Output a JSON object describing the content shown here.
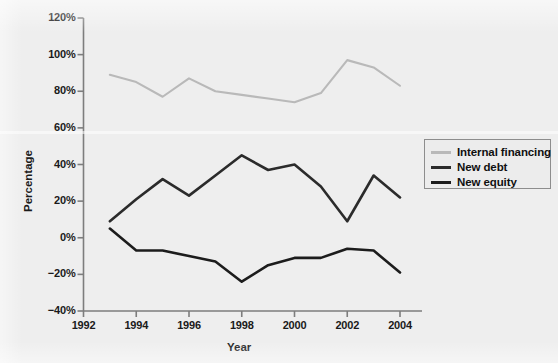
{
  "figure": {
    "background_color": "#efefef",
    "plot_background_color": "#eeeeee"
  },
  "axes": {
    "ylabel": "Percentage",
    "xlabel": "Year",
    "ytick_labels": [
      "120%",
      "100%",
      "80%",
      "60%",
      "40%",
      "20%",
      "0%",
      "−20%",
      "−40%"
    ],
    "xtick_labels": [
      "1992",
      "1994",
      "1996",
      "1998",
      "2000",
      "2002",
      "2004"
    ]
  },
  "legend": {
    "items": [
      {
        "label": "Internal financing",
        "color": "#b9b9b9"
      },
      {
        "label": "New debt",
        "color": "#2b2b2b"
      },
      {
        "label": "New equity",
        "color": "#1c1c1c"
      }
    ]
  },
  "chart_data": {
    "type": "line",
    "title": "",
    "xlabel": "Year",
    "ylabel": "Percentage",
    "x": [
      1993,
      1994,
      1995,
      1996,
      1997,
      1998,
      1999,
      2000,
      2001,
      2002,
      2003,
      2004
    ],
    "xlim": [
      1992,
      2004
    ],
    "ylim": [
      -40,
      120
    ],
    "ytick_values": [
      120,
      100,
      80,
      60,
      40,
      20,
      0,
      -20,
      -40
    ],
    "xtick_values": [
      1992,
      1994,
      1996,
      1998,
      2000,
      2002,
      2004
    ],
    "grid": false,
    "legend_position": "right",
    "series": [
      {
        "name": "Internal financing",
        "color": "#b9b9b9",
        "values": [
          89,
          85,
          77,
          87,
          80,
          78,
          76,
          74,
          79,
          97,
          93,
          83
        ]
      },
      {
        "name": "New debt",
        "color": "#2b2b2b",
        "values": [
          9,
          21,
          32,
          23,
          34,
          45,
          37,
          40,
          28,
          9,
          34,
          22
        ]
      },
      {
        "name": "New equity",
        "color": "#1c1c1c",
        "values": [
          5,
          -7,
          -7,
          -10,
          -13,
          -24,
          -15,
          -11,
          -11,
          -6,
          -7,
          -19
        ]
      }
    ]
  }
}
